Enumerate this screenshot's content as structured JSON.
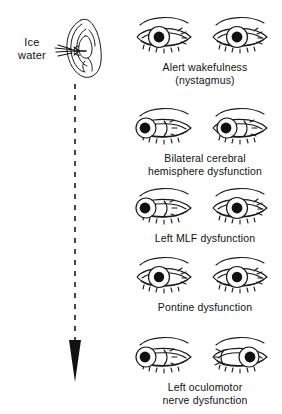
{
  "figure": {
    "type": "medical-line-diagram",
    "background_color": "#ffffff",
    "ink_color": "#111111"
  },
  "stimulus": {
    "label_line1": "Ice",
    "label_line2": "water",
    "ear_icon": "ear-line-drawing",
    "arrow_icon": "down-arrow-dashed",
    "arrow_direction": "down"
  },
  "responses": [
    {
      "id": "alert-wakefulness",
      "caption_line1": "Alert wakefulness",
      "caption_line2": "(nystagmus)",
      "left_eye": {
        "pupil_position": "center",
        "pupil_offset_px": 0
      },
      "right_eye": {
        "pupil_position": "center",
        "pupil_offset_px": 0
      }
    },
    {
      "id": "bilateral-cerebral-hemisphere-dysfunction",
      "caption_line1": "Bilateral cerebral",
      "caption_line2": "hemisphere dysfunction",
      "left_eye": {
        "pupil_position": "far-left",
        "pupil_offset_px": -13
      },
      "right_eye": {
        "pupil_position": "left",
        "pupil_offset_px": -9
      }
    },
    {
      "id": "left-mlf-dysfunction",
      "caption_line1": "Left MLF dysfunction",
      "caption_line2": "",
      "left_eye": {
        "pupil_position": "far-left",
        "pupil_offset_px": -13
      },
      "right_eye": {
        "pupil_position": "center",
        "pupil_offset_px": 0
      }
    },
    {
      "id": "pontine-dysfunction",
      "caption_line1": "Pontine dysfunction",
      "caption_line2": "",
      "left_eye": {
        "pupil_position": "center",
        "pupil_offset_px": 0
      },
      "right_eye": {
        "pupil_position": "center",
        "pupil_offset_px": 0
      }
    },
    {
      "id": "left-oculomotor-nerve-dysfunction",
      "caption_line1": "Left oculomotor",
      "caption_line2": "nerve dysfunction",
      "left_eye": {
        "pupil_position": "far-left",
        "pupil_offset_px": -13
      },
      "right_eye": {
        "pupil_position": "far-right",
        "pupil_offset_px": 11
      }
    }
  ]
}
